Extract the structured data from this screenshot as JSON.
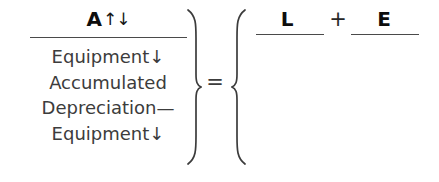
{
  "figure": {
    "background_color": "#ffffff",
    "text_color": "#3c3c3c",
    "bold_text_color": "#0d0d0d",
    "rule_color": "#4a4a4a"
  },
  "left_side": {
    "numerator": {
      "term": "A",
      "arrows": "↑↓"
    },
    "denominator_lines": [
      "Equipment↓",
      "Accumulated",
      "Depreciation—",
      "Equipment↓"
    ]
  },
  "operators": {
    "equals": "=",
    "plus": "+",
    "brace_close": "}",
    "brace_open": "{"
  },
  "right_side": {
    "terms": [
      {
        "label": "L"
      },
      {
        "label": "E"
      }
    ]
  }
}
